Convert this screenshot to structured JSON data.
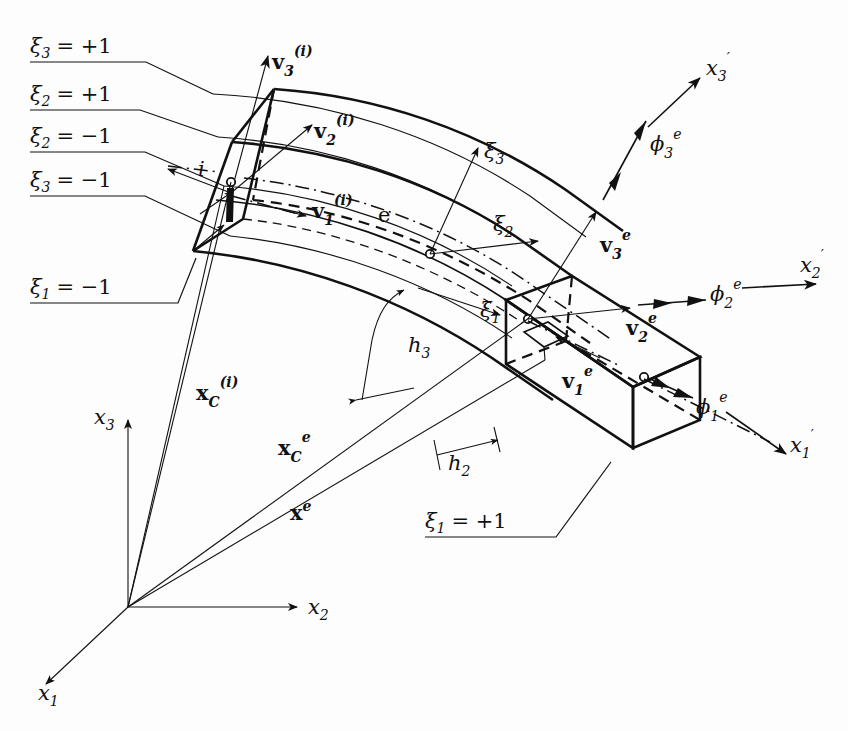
{
  "figure": {
    "background_color": "#fdfdfd",
    "ink_color": "#111111"
  },
  "labels": {
    "xi3_plus": {
      "var": "ξ",
      "sub": "3",
      "eq": "= +1"
    },
    "xi2_plus": {
      "var": "ξ",
      "sub": "2",
      "eq": "= +1"
    },
    "xi2_minus": {
      "var": "ξ",
      "sub": "2",
      "eq": "= −1"
    },
    "xi3_minus": {
      "var": "ξ",
      "sub": "3",
      "eq": "= −1"
    },
    "xi1_minus": {
      "var": "ξ",
      "sub": "1",
      "eq": "= −1"
    },
    "xi1_plus": {
      "var": "ξ",
      "sub": "1",
      "eq": "= +1"
    }
  },
  "nodal_vectors": [
    {
      "name": "v3-nodal",
      "base": "v",
      "sub": "3",
      "sup": "(i)"
    },
    {
      "name": "v2-nodal",
      "base": "v",
      "sub": "2",
      "sup": "(i)"
    },
    {
      "name": "v1-nodal",
      "base": "v",
      "sub": "1",
      "sup": "(i)"
    }
  ],
  "element_vectors": [
    {
      "name": "v3-element",
      "base": "v",
      "sub": "3",
      "sup": "e"
    },
    {
      "name": "v2-element",
      "base": "v",
      "sub": "2",
      "sup": "e"
    },
    {
      "name": "v1-element",
      "base": "v",
      "sub": "1",
      "sup": "e"
    }
  ],
  "rotations": [
    {
      "name": "phi3",
      "base": "ϕ",
      "sub": "3",
      "sup": "e"
    },
    {
      "name": "phi2",
      "base": "ϕ",
      "sub": "2",
      "sup": "e"
    },
    {
      "name": "phi1",
      "base": "ϕ",
      "sub": "1",
      "sup": "e"
    }
  ],
  "primed_axes": [
    {
      "name": "x3-prime",
      "base": "x",
      "sub": "3",
      "prime": "′"
    },
    {
      "name": "x2-prime",
      "base": "x",
      "sub": "2",
      "prime": "′"
    },
    {
      "name": "x1-prime",
      "base": "x",
      "sub": "1",
      "prime": "′"
    }
  ],
  "global_axes": [
    {
      "name": "x3-axis",
      "base": "x",
      "sub": "3"
    },
    {
      "name": "x2-axis",
      "base": "x",
      "sub": "2"
    },
    {
      "name": "x1-axis",
      "base": "x",
      "sub": "1"
    }
  ],
  "natural_axes": [
    {
      "name": "xi3-axis",
      "base": "ξ",
      "sub": "3"
    },
    {
      "name": "xi2-axis",
      "base": "ξ",
      "sub": "2"
    },
    {
      "name": "xi1-axis",
      "base": "ξ",
      "sub": "1"
    }
  ],
  "position_vectors": [
    {
      "name": "xc-nodal",
      "base": "x",
      "sub": "C",
      "sup": "(i)"
    },
    {
      "name": "xc-element",
      "base": "x",
      "sub": "C",
      "sup": "e"
    },
    {
      "name": "x-element",
      "base": "x",
      "sub": "",
      "sup": "e"
    }
  ],
  "thickness_labels": [
    {
      "name": "h3",
      "base": "h",
      "sub": "3"
    },
    {
      "name": "h2",
      "base": "h",
      "sub": "2"
    }
  ],
  "point_markers": [
    {
      "name": "node-i",
      "text": "i"
    },
    {
      "name": "element-e",
      "text": "e"
    }
  ]
}
